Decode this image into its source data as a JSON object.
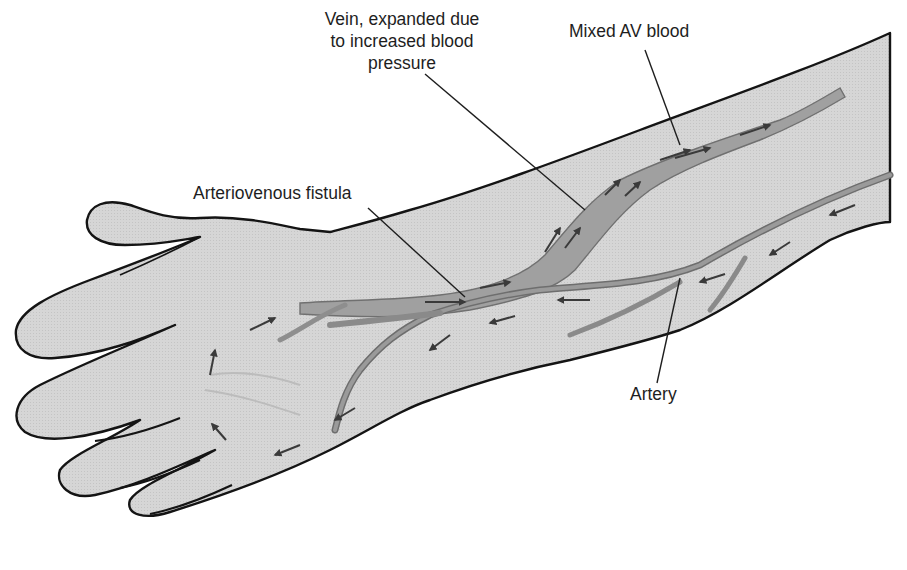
{
  "diagram": {
    "colors": {
      "background": "#ffffff",
      "skin_fill": "#d9d9d9",
      "outline": "#141414",
      "vein_fill": "#9a9a9a",
      "vein_edge": "#6e6e6e",
      "artery_fill": "#8c8c8c",
      "arrow": "#3a3a3a",
      "leader_line": "#1e1e1e",
      "label_text": "#1e1e1e"
    },
    "labels": {
      "vein": {
        "line1": "Vein, expanded due",
        "line2": "to increased blood",
        "line3": "pressure"
      },
      "mixed_av_blood": "Mixed AV blood",
      "arteriovenous_fistula": "Arteriovenous fistula",
      "artery": "Artery"
    },
    "structures": [
      "hand",
      "forearm",
      "expanded vein",
      "artery",
      "arteriovenous fistula",
      "flow arrows"
    ]
  }
}
